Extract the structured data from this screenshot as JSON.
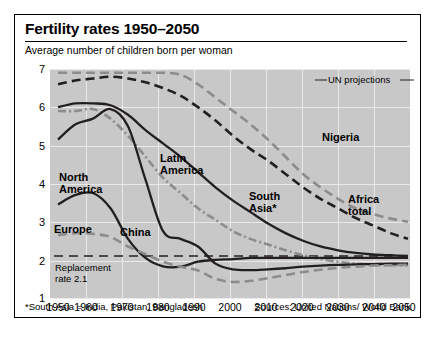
{
  "header": {
    "title": "Fertility rates 1950–2050",
    "subtitle": "Average number of children born per woman"
  },
  "footer": {
    "footnote": "*South Asia = India, Pakistan, Bangladesh",
    "source": "Sources: United Nations/ World Bank"
  },
  "annotations": {
    "un_projections": "UN projections",
    "replacement_rate": "Replacement\nrate 2.1"
  },
  "labels": {
    "north_america": "North\nAmerica",
    "europe": "Europe",
    "china": "China",
    "latin_america": "Latin\nAmerica",
    "south_asia": "South\nAsia*",
    "africa_total": "Africa\ntotal",
    "nigeria": "Nigeria"
  },
  "colors": {
    "plot_background": "#c8c8c8",
    "gridline": "#e9e9e9",
    "dark_line": "#231f20",
    "grey_line": "#8c8c8c",
    "border": "#000000"
  },
  "chart_data": {
    "type": "line",
    "title": "Fertility rates 1950–2050",
    "subtitle": "Average number of children born per woman",
    "xlabel": "",
    "ylabel": "Average number of children born per woman",
    "xlim": [
      1950,
      2050
    ],
    "ylim": [
      1,
      7
    ],
    "yticks": [
      1,
      2,
      3,
      4,
      5,
      6,
      7
    ],
    "xticks": [
      1950,
      1960,
      1970,
      1980,
      1990,
      2000,
      2010,
      2020,
      2030,
      2040,
      2050
    ],
    "grid": true,
    "legend_position": "inline-labels",
    "projection_starts": 2005,
    "reference_lines": [
      {
        "label": "Replacement rate 2.1",
        "y": 2.1,
        "style": "dashed"
      }
    ],
    "x": [
      1950,
      1955,
      1960,
      1965,
      1970,
      1975,
      1980,
      1985,
      1990,
      1995,
      2000,
      2005,
      2010,
      2015,
      2020,
      2025,
      2030,
      2035,
      2040,
      2045,
      2050
    ],
    "series": [
      {
        "name": "Nigeria",
        "style": "dashed",
        "color": "#8c8c8c",
        "values": [
          6.9,
          6.9,
          6.9,
          6.9,
          6.9,
          6.9,
          6.9,
          6.85,
          6.6,
          6.25,
          5.9,
          5.55,
          5.15,
          4.7,
          4.25,
          3.9,
          3.6,
          3.35,
          3.2,
          3.08,
          3.0
        ]
      },
      {
        "name": "Africa total",
        "style": "dashed",
        "color": "#231f20",
        "values": [
          6.6,
          6.7,
          6.75,
          6.8,
          6.75,
          6.65,
          6.5,
          6.3,
          6.0,
          5.65,
          5.25,
          4.9,
          4.6,
          4.25,
          3.9,
          3.6,
          3.35,
          3.1,
          2.9,
          2.7,
          2.55
        ]
      },
      {
        "name": "South Asia*",
        "style": "solid",
        "color": "#231f20",
        "values": [
          6.0,
          6.1,
          6.1,
          6.05,
          5.8,
          5.4,
          5.05,
          4.7,
          4.3,
          3.9,
          3.55,
          3.25,
          2.95,
          2.7,
          2.5,
          2.35,
          2.25,
          2.18,
          2.14,
          2.12,
          2.1
        ]
      },
      {
        "name": "Latin America",
        "style": "dash-dot",
        "color": "#8c8c8c",
        "values": [
          5.9,
          5.9,
          5.95,
          5.7,
          5.25,
          4.7,
          4.15,
          3.75,
          3.35,
          3.05,
          2.75,
          2.55,
          2.4,
          2.25,
          2.12,
          2.02,
          1.95,
          1.9,
          1.87,
          1.86,
          1.85
        ]
      },
      {
        "name": "China",
        "style": "solid",
        "color": "#231f20",
        "values": [
          5.15,
          5.55,
          5.7,
          5.95,
          5.5,
          4.1,
          2.75,
          2.55,
          2.35,
          1.9,
          1.75,
          1.73,
          1.75,
          1.78,
          1.82,
          1.85,
          1.87,
          1.88,
          1.89,
          1.9,
          1.9
        ]
      },
      {
        "name": "North America",
        "style": "solid",
        "color": "#231f20",
        "values": [
          3.45,
          3.7,
          3.75,
          3.35,
          2.55,
          2.05,
          1.83,
          1.82,
          1.95,
          2.0,
          2.02,
          2.05,
          2.05,
          2.05,
          2.05,
          2.05,
          2.05,
          2.05,
          2.05,
          2.05,
          2.05
        ]
      },
      {
        "name": "Europe",
        "style": "dashed",
        "color": "#8c8c8c",
        "values": [
          2.65,
          2.7,
          2.68,
          2.6,
          2.35,
          2.15,
          1.95,
          1.82,
          1.72,
          1.5,
          1.42,
          1.45,
          1.52,
          1.6,
          1.68,
          1.74,
          1.79,
          1.82,
          1.85,
          1.86,
          1.87
        ]
      }
    ]
  }
}
